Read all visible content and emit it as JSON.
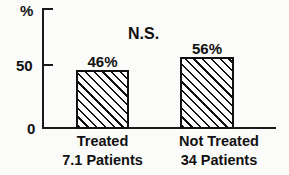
{
  "chart_data": {
    "type": "bar",
    "title": "",
    "subtitle": "",
    "xlabel": "",
    "ylabel": "%",
    "ylim": [
      0,
      100
    ],
    "grid": false,
    "legend": false,
    "categories": [
      "Treated",
      "Not Treated"
    ],
    "category_sublabels": [
      "7.1 Patients",
      "34 Patients"
    ],
    "values": [
      46,
      56
    ],
    "value_labels": [
      "46%",
      "56%"
    ],
    "ytick_labels": [
      "0",
      "50"
    ],
    "ytick_values": [
      0,
      50
    ],
    "annotations": [
      "N.S."
    ],
    "bar_style": "diagonal-hatch",
    "colors": {
      "ink": "#111111",
      "background": "#fbfbf9",
      "bar_fill": "#ffffff"
    }
  },
  "axes": {
    "y_unit_label": "%",
    "tick_0": "0",
    "tick_50": "50"
  },
  "bars": [
    {
      "value_label": "46%",
      "category": "Treated",
      "sublabel": "7.1 Patients"
    },
    {
      "value_label": "56%",
      "category": "Not Treated",
      "sublabel": "34 Patients"
    }
  ],
  "significance": {
    "label": "N.S."
  }
}
